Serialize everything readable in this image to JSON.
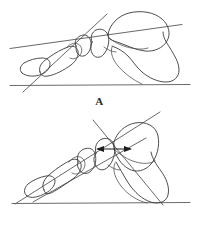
{
  "figure": {
    "background_color": "#ffffff",
    "line_color": "#3a3a3a",
    "width": 199,
    "height": 234,
    "panels": [
      {
        "id": "A",
        "label": "A",
        "description": "Lateral foot bone tracing with talar axis line and ground reference line",
        "annotations": {
          "axis_line": "long oblique talar/first-metatarsal axis line",
          "ground_line": "horizontal weight-bearing ground reference line",
          "arrow": null
        }
      },
      {
        "id": "B",
        "label": "B",
        "description": "Lateral foot bone tracing with crossing axis lines, double-headed measurement arrow and ground reference line",
        "annotations": {
          "axis_line": "long oblique axis line crossing steep calcaneal axis line",
          "ground_line": "horizontal weight-bearing ground reference line",
          "arrow": "double-headed horizontal displacement arrow"
        }
      }
    ]
  }
}
